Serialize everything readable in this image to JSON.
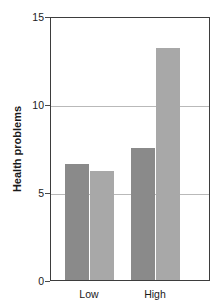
{
  "chart_data": {
    "type": "bar",
    "title": "",
    "xlabel": "",
    "ylabel": "Health problems",
    "categories": [
      "Low",
      "High"
    ],
    "series": [
      {
        "name": "series-1",
        "values": [
          6.6,
          7.5
        ],
        "color": "#8a8a8a"
      },
      {
        "name": "series-2",
        "values": [
          6.2,
          13.2
        ],
        "color": "#a8a8a8"
      }
    ],
    "ylim": [
      0,
      15
    ],
    "yticks": [
      0,
      5,
      10,
      15
    ],
    "ytick_labels": [
      "0",
      "5",
      "10",
      "15"
    ],
    "gridlines_at": [
      5,
      10
    ],
    "grid": true,
    "legend": "none",
    "frame": true
  },
  "axes": {
    "y_title": "Health problems",
    "tick_0": "0",
    "tick_5": "5",
    "tick_10": "10",
    "tick_15": "15",
    "cat_low": "Low",
    "cat_high": "High"
  }
}
